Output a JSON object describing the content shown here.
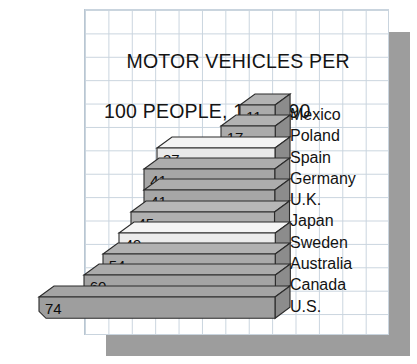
{
  "chart_data": {
    "type": "bar",
    "orientation": "horizontal",
    "style": "3d-staircase-pyramid",
    "title": "MOTOR VEHICLES PER 100 PEOPLE, 1989–90",
    "title_line1": "MOTOR VEHICLES PER",
    "title_line2": "100 PEOPLE, 1989–90",
    "xlabel": "",
    "ylabel": "",
    "unit": "motor vehicles per 100 people",
    "period": "1989–90",
    "grid": true,
    "legend": "none",
    "xlim": [
      0,
      74
    ],
    "categories": [
      "Mexico",
      "Poland",
      "Spain",
      "Germany",
      "U.K.",
      "Japan",
      "Sweden",
      "Australia",
      "Canada",
      "U.S."
    ],
    "values": [
      11,
      17,
      37,
      41,
      41,
      45,
      49,
      54,
      60,
      74
    ],
    "bars": [
      {
        "label": "Mexico",
        "value": 11,
        "value_text": "11",
        "fill": "#ababab"
      },
      {
        "label": "Poland",
        "value": 17,
        "value_text": "17",
        "fill": "#ababab"
      },
      {
        "label": "Spain",
        "value": 37,
        "value_text": "37",
        "fill": "#eaeaea"
      },
      {
        "label": "Germany",
        "value": 41,
        "value_text": "41",
        "fill": "#a6a6a6"
      },
      {
        "label": "U.K.",
        "value": 41,
        "value_text": "41",
        "fill": "#a6a6a6"
      },
      {
        "label": "Japan",
        "value": 45,
        "value_text": "45",
        "fill": "#b0b0b0"
      },
      {
        "label": "Sweden",
        "value": 49,
        "value_text": "49",
        "fill": "#ececec"
      },
      {
        "label": "Australia",
        "value": 54,
        "value_text": "54",
        "fill": "#aaaaaa"
      },
      {
        "label": "Canada",
        "value": 60,
        "value_text": "60",
        "fill": "#a4a4a4"
      },
      {
        "label": "U.S.",
        "value": 74,
        "value_text": "74",
        "fill": "#9e9e9e"
      }
    ]
  },
  "colors": {
    "panel_background": "#ffffff",
    "grid_line": "#c9d4de",
    "drop_shadow": "#9d9d9d",
    "bar_fill_dark": "#a6a6a6",
    "bar_fill_light": "#eaeaea",
    "bar_side_face": "#8c8c8c",
    "bar_outline": "#2b2b2b",
    "text": "#131313"
  },
  "labels_column": {
    "items": [
      "Mexico",
      "Poland",
      "Spain",
      "Germany",
      "U.K.",
      "Japan",
      "Sweden",
      "Australia",
      "Canada",
      "U.S."
    ]
  }
}
